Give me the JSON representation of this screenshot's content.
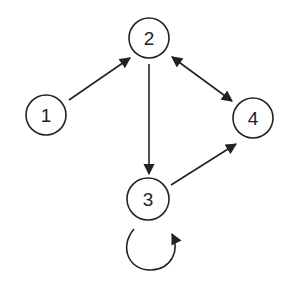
{
  "diagram": {
    "type": "directed-graph",
    "colors": {
      "stroke": "#222222",
      "background": "#ffffff"
    },
    "nodes": [
      {
        "id": "1",
        "label": "1",
        "cx": 46,
        "cy": 115
      },
      {
        "id": "2",
        "label": "2",
        "cx": 149,
        "cy": 38
      },
      {
        "id": "3",
        "label": "3",
        "cx": 148,
        "cy": 199
      },
      {
        "id": "4",
        "label": "4",
        "cx": 253,
        "cy": 118
      }
    ],
    "edges": [
      {
        "from": "1",
        "to": "2",
        "direction": "forward"
      },
      {
        "from": "2",
        "to": "3",
        "direction": "forward"
      },
      {
        "from": "2",
        "to": "4",
        "direction": "bidirectional"
      },
      {
        "from": "3",
        "to": "4",
        "direction": "forward"
      },
      {
        "from": "3",
        "to": "3",
        "direction": "self-loop"
      }
    ]
  }
}
